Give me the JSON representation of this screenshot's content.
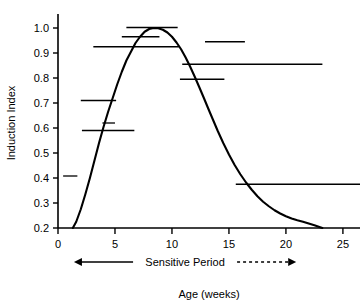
{
  "chart_data": {
    "type": "line",
    "title": "",
    "xlabel": "Age (weeks)",
    "ylabel": "Induction Index",
    "xlim": [
      0,
      26.5
    ],
    "ylim": [
      0.2,
      1.04
    ],
    "grid": false,
    "legend": "none",
    "x_ticks": [
      0,
      5,
      10,
      15,
      20,
      25
    ],
    "x_tick_labels": [
      "0",
      "5",
      "10",
      "15",
      "20",
      "25"
    ],
    "y_ticks": [
      0.2,
      0.3,
      0.4,
      0.5,
      0.6,
      0.7,
      0.8,
      0.9,
      1.0
    ],
    "y_tick_labels": [
      "0.2",
      "0.3",
      "0.4",
      "0.5",
      "0.6",
      "0.7",
      "0.8",
      "0.9",
      "1.0"
    ],
    "curve_label": "Induction index fitted curve",
    "curve": {
      "x": [
        1.3,
        1.6,
        2.0,
        2.4,
        2.8,
        3.2,
        3.6,
        4.0,
        4.4,
        4.8,
        5.2,
        5.6,
        6.0,
        6.4,
        6.8,
        7.2,
        7.6,
        8.0,
        8.4,
        8.8,
        9.2,
        9.6,
        10.0,
        10.4,
        10.8,
        11.2,
        11.6,
        12.0,
        12.4,
        12.8,
        13.2,
        13.6,
        14.0,
        14.5,
        15.0,
        15.5,
        16.0,
        16.5,
        17.0,
        17.5,
        18.0,
        18.5,
        19.0,
        19.5,
        20.0,
        20.5,
        21.0,
        21.5,
        22.0,
        22.5,
        23.0,
        23.2
      ],
      "y": [
        0.2,
        0.225,
        0.275,
        0.335,
        0.4,
        0.47,
        0.54,
        0.605,
        0.665,
        0.72,
        0.775,
        0.825,
        0.87,
        0.905,
        0.94,
        0.965,
        0.985,
        0.996,
        1.0,
        0.999,
        0.993,
        0.982,
        0.965,
        0.942,
        0.915,
        0.882,
        0.845,
        0.805,
        0.763,
        0.72,
        0.676,
        0.633,
        0.59,
        0.54,
        0.494,
        0.452,
        0.415,
        0.382,
        0.353,
        0.327,
        0.305,
        0.287,
        0.271,
        0.258,
        0.247,
        0.238,
        0.231,
        0.225,
        0.218,
        0.211,
        0.203,
        0.2
      ]
    },
    "interval_bars_label": "Confidence interval bars",
    "interval_bars": [
      {
        "id": "bar-1.00",
        "y": 1.002,
        "x_start": 6.0,
        "x_end": 10.5
      },
      {
        "id": "bar-0.965",
        "y": 0.965,
        "x_start": 5.6,
        "x_end": 8.9
      },
      {
        "id": "bar-0.945",
        "y": 0.945,
        "x_start": 12.9,
        "x_end": 16.4
      },
      {
        "id": "bar-0.925",
        "y": 0.925,
        "x_start": 3.1,
        "x_end": 10.6
      },
      {
        "id": "bar-0.855",
        "y": 0.855,
        "x_start": 10.9,
        "x_end": 23.2
      },
      {
        "id": "bar-0.795",
        "y": 0.795,
        "x_start": 10.7,
        "x_end": 14.6
      },
      {
        "id": "bar-0.710",
        "y": 0.71,
        "x_start": 2.0,
        "x_end": 5.1
      },
      {
        "id": "bar-0.620",
        "y": 0.62,
        "x_start": 3.9,
        "x_end": 5.0
      },
      {
        "id": "bar-0.590",
        "y": 0.59,
        "x_start": 2.1,
        "x_end": 6.7
      },
      {
        "id": "bar-0.408",
        "y": 0.408,
        "x_start": 0.45,
        "x_end": 1.7
      },
      {
        "id": "bar-0.375",
        "y": 0.375,
        "x_start": 15.6,
        "x_end": 26.5
      }
    ],
    "annotations": [
      {
        "id": "sensitive-period",
        "text": "Sensitive Period",
        "arrow_left_x": 1.4,
        "arrow_right_x": 20.9,
        "style": "double-headed arrow with dashed right segment"
      }
    ]
  },
  "axis": {
    "y_title": "Induction Index",
    "x_title": "Age (weeks)"
  },
  "colors": {
    "curve": "#000000",
    "interval_bar": "#000000",
    "axis": "#000000",
    "background": "#ffffff"
  }
}
